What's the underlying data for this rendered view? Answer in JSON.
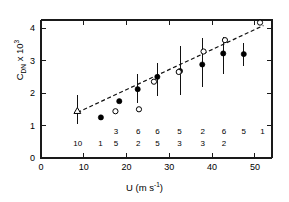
{
  "chart_data": {
    "type": "scatter",
    "title": "",
    "xlabel": "U (m s-1)",
    "xlabel_parts": {
      "main": "U (m s",
      "sup": "-1",
      "tail": ")"
    },
    "ylabel": "CDN x 10^3",
    "ylabel_parts": {
      "main": "C",
      "sub": "DN",
      "mid": " x 10",
      "sup": "3"
    },
    "xlim": [
      0,
      54
    ],
    "ylim": [
      0,
      4.25
    ],
    "xticks": [
      0,
      10,
      20,
      30,
      40,
      50
    ],
    "xticklabels": [
      "0",
      "10",
      "20",
      "30",
      "40",
      "50"
    ],
    "yticks": [
      0,
      1,
      2,
      3,
      4
    ],
    "yticklabels": [
      "0",
      "1",
      "2",
      "3",
      "4"
    ],
    "grid": false,
    "legend": "none",
    "series": [
      {
        "name": "open triangle",
        "marker": "open-triangle",
        "points": [
          {
            "x": 8.5,
            "y": 1.45,
            "yerr_low": 1.05,
            "yerr_high": 1.95
          }
        ]
      },
      {
        "name": "filled circles",
        "marker": "filled-circle",
        "points": [
          {
            "x": 14.0,
            "y": 1.25,
            "yerr_low": 1.25,
            "yerr_high": 1.25
          },
          {
            "x": 18.3,
            "y": 1.75,
            "yerr_low": 1.75,
            "yerr_high": 1.75
          },
          {
            "x": 22.6,
            "y": 2.12,
            "yerr_low": 1.68,
            "yerr_high": 2.58
          },
          {
            "x": 27.2,
            "y": 2.5,
            "yerr_low": 1.92,
            "yerr_high": 2.92
          },
          {
            "x": 32.5,
            "y": 2.68,
            "yerr_low": 1.95,
            "yerr_high": 3.45
          },
          {
            "x": 37.7,
            "y": 2.88,
            "yerr_low": 2.18,
            "yerr_high": 3.7
          },
          {
            "x": 42.6,
            "y": 3.22,
            "yerr_low": 2.58,
            "yerr_high": 3.72
          },
          {
            "x": 47.4,
            "y": 3.2,
            "yerr_low": 2.82,
            "yerr_high": 3.55
          }
        ]
      },
      {
        "name": "open circles",
        "marker": "open-circle",
        "points": [
          {
            "x": 17.4,
            "y": 1.44
          },
          {
            "x": 22.9,
            "y": 1.5
          },
          {
            "x": 26.4,
            "y": 2.35
          },
          {
            "x": 32.2,
            "y": 2.65
          },
          {
            "x": 38.0,
            "y": 3.28
          },
          {
            "x": 43.0,
            "y": 3.63
          },
          {
            "x": 51.2,
            "y": 4.17
          }
        ]
      }
    ],
    "fit_line": {
      "style": "dashed",
      "x0": 8.5,
      "y0": 1.4,
      "x1": 52.0,
      "y1": 4.08
    },
    "counts": {
      "description": "Sample counts printed inside the axes near the bottom, two rows",
      "top_row": [
        {
          "x": 17.5,
          "label": "3"
        },
        {
          "x": 22.7,
          "label": "6"
        },
        {
          "x": 27.2,
          "label": "6"
        },
        {
          "x": 32.4,
          "label": "5"
        },
        {
          "x": 37.8,
          "label": "2"
        },
        {
          "x": 42.8,
          "label": "6"
        },
        {
          "x": 47.4,
          "label": "5"
        },
        {
          "x": 51.8,
          "label": "1"
        }
      ],
      "bottom_row": [
        {
          "x": 8.6,
          "label": "10"
        },
        {
          "x": 13.9,
          "label": "1"
        },
        {
          "x": 17.5,
          "label": "5"
        },
        {
          "x": 22.7,
          "label": "2"
        },
        {
          "x": 27.2,
          "label": "5"
        },
        {
          "x": 32.4,
          "label": "3"
        },
        {
          "x": 37.8,
          "label": "3"
        },
        {
          "x": 42.8,
          "label": "2"
        }
      ]
    },
    "colors": {
      "axis": "#1a1a1a",
      "marker_filled": "#000000",
      "marker_open_fill": "#ffffff",
      "marker_open_stroke": "#000000",
      "fit_line": "#111111",
      "background": "#ffffff"
    }
  }
}
